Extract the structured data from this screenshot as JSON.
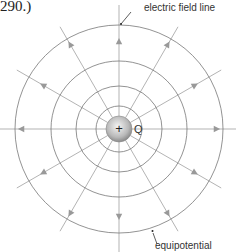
{
  "caption": "290.)",
  "labels": {
    "field_line": "electric field line",
    "equipotential": "equipotential",
    "charge": "Q",
    "charge_sign": "+"
  },
  "diagram": {
    "center": [
      119,
      129
    ],
    "equipotential_radii": [
      104,
      68,
      43,
      23
    ],
    "charge_radius": 13,
    "field_line_count": 12,
    "colors": {
      "circle": "#777777",
      "field_line": "#aaaaaa",
      "arrow": "#999999",
      "text": "#333333"
    }
  }
}
